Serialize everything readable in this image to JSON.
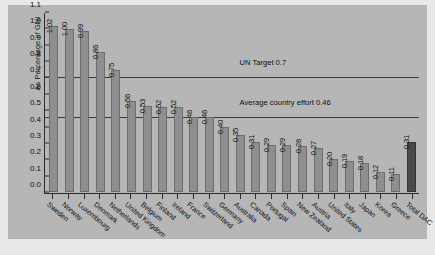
{
  "chart_data": {
    "type": "bar",
    "title": "",
    "xlabel": "",
    "ylabel": "As Percentage of GNI",
    "ylim": [
      0,
      1.1
    ],
    "yticks": [
      "0.0",
      "0.1",
      "0.2",
      "0.3",
      "0.4",
      "0.5",
      "0.6",
      "0.7",
      "0.8",
      "0.9",
      "1.0",
      "1.1"
    ],
    "grid": false,
    "legend": "none",
    "categories": [
      "Sweden",
      "Norway",
      "Luxembourg",
      "Denmark",
      "Netherlands",
      "United Kingdom",
      "Belgium",
      "Finland",
      "Ireland",
      "France",
      "Switzerland",
      "Germany",
      "Australia",
      "Canada",
      "Portugal",
      "Spain",
      "New Zealand",
      "Austria",
      "United States",
      "Italy",
      "Japan",
      "Korea",
      "Greece",
      "Total DAC"
    ],
    "values": [
      1.02,
      1.0,
      0.99,
      0.86,
      0.75,
      0.56,
      0.53,
      0.52,
      0.52,
      0.46,
      0.46,
      0.4,
      0.35,
      0.31,
      0.29,
      0.29,
      0.28,
      0.27,
      0.2,
      0.19,
      0.18,
      0.12,
      0.11,
      0.31
    ],
    "value_labels": [
      "1.02",
      "1.00",
      "0.99",
      "0.86",
      "0.75",
      "0.56",
      "0.53",
      "0.52",
      "0.52",
      "0.46",
      "0.46",
      "0.40",
      "0.35",
      "0.31",
      "0.29",
      "0.29",
      "0.28",
      "0.27",
      "0.20",
      "0.19",
      "0.18",
      "0.12",
      "0.11",
      "0.31"
    ],
    "highlight_index": 23,
    "reference_lines": [
      {
        "label": "UN Target 0.7",
        "value": 0.7
      },
      {
        "label": "Average country effort 0.46",
        "value": 0.46
      }
    ],
    "colors": {
      "bar": "#8f8f8f",
      "bar_highlight": "#4a4a4a",
      "plot_background": "#b6b6b6",
      "axis": "#2b2b2b",
      "reference_line": "#3a3a3a",
      "text": "#111111"
    }
  }
}
